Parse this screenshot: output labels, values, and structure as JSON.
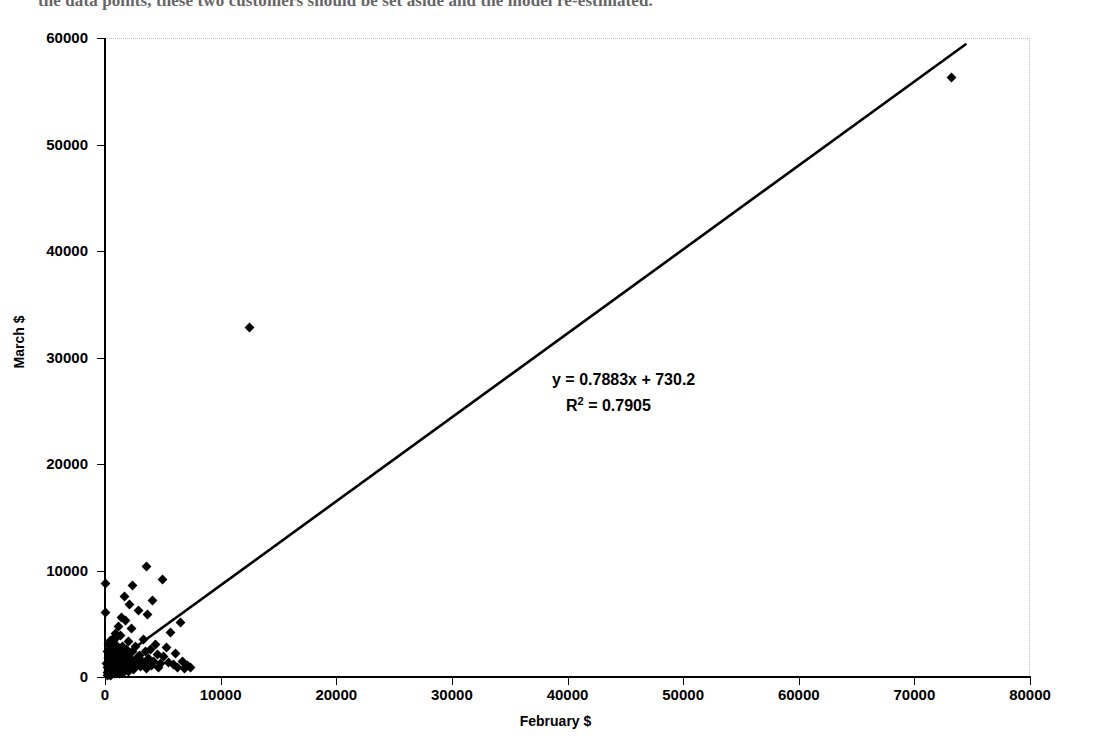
{
  "page": {
    "body_text_fragment": "the data points, these two customers should be set aside and the model re-estimated."
  },
  "chart_data": {
    "type": "scatter",
    "title": "",
    "xlabel": "February $",
    "ylabel": "March $",
    "xlim": [
      0,
      80000
    ],
    "ylim": [
      0,
      60000
    ],
    "xticks": [
      0,
      10000,
      20000,
      30000,
      40000,
      50000,
      60000,
      70000,
      80000
    ],
    "yticks": [
      0,
      10000,
      20000,
      30000,
      40000,
      50000,
      60000
    ],
    "xtick_labels": [
      "0",
      "10000",
      "20000",
      "30000",
      "40000",
      "50000",
      "60000",
      "70000",
      "80000"
    ],
    "ytick_labels": [
      "0",
      "10000",
      "20000",
      "30000",
      "40000",
      "50000",
      "60000"
    ],
    "grid": false,
    "legend": null,
    "marker": "diamond",
    "marker_color": "#000000",
    "annotations": [
      {
        "name": "trendline-equation",
        "text": "y = 0.7883x + 730.2"
      },
      {
        "name": "r-squared",
        "text": "R2 = 0.7905",
        "base": "R",
        "exponent": "2",
        "value": "= 0.7905"
      }
    ],
    "trendline": {
      "type": "linear",
      "slope": 0.7883,
      "intercept": 730.2,
      "r_squared": 0.7905,
      "x_start": 0,
      "x_end": 74500,
      "color": "#000000"
    },
    "points": [
      [
        0,
        8800
      ],
      [
        0,
        6100
      ],
      [
        150,
        1250
      ],
      [
        180,
        430
      ],
      [
        200,
        2350
      ],
      [
        220,
        900
      ],
      [
        240,
        150
      ],
      [
        260,
        1850
      ],
      [
        280,
        620
      ],
      [
        300,
        3050
      ],
      [
        310,
        1100
      ],
      [
        330,
        260
      ],
      [
        350,
        2100
      ],
      [
        370,
        780
      ],
      [
        390,
        1500
      ],
      [
        400,
        340
      ],
      [
        420,
        2600
      ],
      [
        440,
        960
      ],
      [
        460,
        180
      ],
      [
        480,
        1700
      ],
      [
        500,
        3400
      ],
      [
        510,
        700
      ],
      [
        530,
        1150
      ],
      [
        550,
        2250
      ],
      [
        570,
        420
      ],
      [
        590,
        1900
      ],
      [
        600,
        250
      ],
      [
        620,
        1400
      ],
      [
        640,
        3150
      ],
      [
        660,
        820
      ],
      [
        680,
        1600
      ],
      [
        700,
        2800
      ],
      [
        710,
        380
      ],
      [
        730,
        1050
      ],
      [
        750,
        2050
      ],
      [
        770,
        560
      ],
      [
        790,
        1750
      ],
      [
        800,
        290
      ],
      [
        820,
        2450
      ],
      [
        840,
        1200
      ],
      [
        860,
        640
      ],
      [
        880,
        3600
      ],
      [
        900,
        1850
      ],
      [
        920,
        470
      ],
      [
        940,
        2300
      ],
      [
        960,
        1000
      ],
      [
        980,
        1550
      ],
      [
        1000,
        2950
      ],
      [
        1020,
        350
      ],
      [
        1040,
        1300
      ],
      [
        1060,
        2150
      ],
      [
        1080,
        730
      ],
      [
        1100,
        1950
      ],
      [
        1120,
        520
      ],
      [
        1150,
        1450
      ],
      [
        1180,
        2700
      ],
      [
        1200,
        880
      ],
      [
        1230,
        1650
      ],
      [
        1260,
        310
      ],
      [
        1290,
        2400
      ],
      [
        1320,
        1150
      ],
      [
        1350,
        3900
      ],
      [
        1380,
        1800
      ],
      [
        1400,
        600
      ],
      [
        1430,
        2250
      ],
      [
        1460,
        1000
      ],
      [
        1500,
        1500
      ],
      [
        1530,
        2850
      ],
      [
        1560,
        400
      ],
      [
        1600,
        1350
      ],
      [
        1640,
        2100
      ],
      [
        1680,
        760
      ],
      [
        1720,
        1900
      ],
      [
        1760,
        5300
      ],
      [
        1800,
        1250
      ],
      [
        1850,
        2550
      ],
      [
        1900,
        900
      ],
      [
        1950,
        1700
      ],
      [
        2000,
        3300
      ],
      [
        2050,
        480
      ],
      [
        2100,
        1400
      ],
      [
        2150,
        2200
      ],
      [
        2200,
        1050
      ],
      [
        2250,
        4600
      ],
      [
        2300,
        1600
      ],
      [
        2400,
        2400
      ],
      [
        2450,
        700
      ],
      [
        2500,
        1300
      ],
      [
        2600,
        2900
      ],
      [
        2700,
        1150
      ],
      [
        2800,
        1850
      ],
      [
        2900,
        6200
      ],
      [
        3000,
        2050
      ],
      [
        3100,
        950
      ],
      [
        3200,
        1500
      ],
      [
        3300,
        3500
      ],
      [
        3400,
        1250
      ],
      [
        3500,
        2350
      ],
      [
        3600,
        800
      ],
      [
        3700,
        5900
      ],
      [
        3800,
        1700
      ],
      [
        3900,
        2600
      ],
      [
        4000,
        1100
      ],
      [
        4100,
        7200
      ],
      [
        4200,
        1450
      ],
      [
        4400,
        3050
      ],
      [
        4500,
        2150
      ],
      [
        4600,
        900
      ],
      [
        4800,
        1250
      ],
      [
        5000,
        9200
      ],
      [
        5100,
        1900
      ],
      [
        5300,
        2750
      ],
      [
        5500,
        1350
      ],
      [
        5700,
        4200
      ],
      [
        5900,
        1150
      ],
      [
        6100,
        2250
      ],
      [
        6300,
        900
      ],
      [
        6500,
        5100
      ],
      [
        6700,
        1500
      ],
      [
        6900,
        800
      ],
      [
        7100,
        1050
      ],
      [
        7400,
        900
      ],
      [
        3600,
        10400
      ],
      [
        2350,
        8600
      ],
      [
        1700,
        7600
      ],
      [
        2100,
        6800
      ],
      [
        1450,
        5600
      ],
      [
        1150,
        4700
      ],
      [
        900,
        4100
      ],
      [
        780,
        3700
      ],
      [
        12500,
        32800
      ],
      [
        73200,
        56300
      ]
    ]
  }
}
